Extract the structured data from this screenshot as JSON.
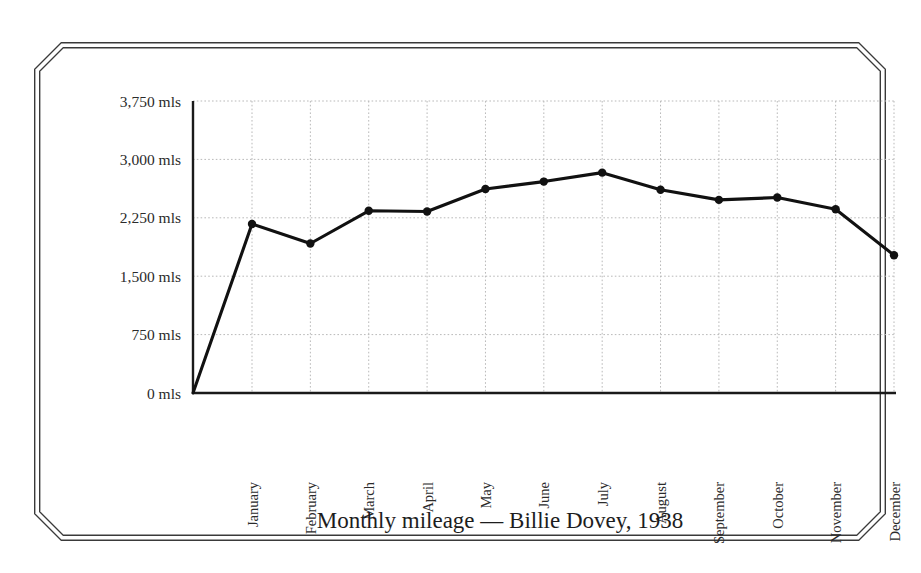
{
  "chart_data": {
    "type": "line",
    "title": "Monthly mileage — Billie Dovey, 1938",
    "xlabel": "",
    "ylabel": "",
    "categories": [
      "January",
      "February",
      "March",
      "April",
      "May",
      "June",
      "July",
      "August",
      "September",
      "October",
      "November",
      "December"
    ],
    "values": [
      2170,
      1920,
      2340,
      2330,
      2620,
      2715,
      2830,
      2610,
      2480,
      2510,
      2360,
      1770
    ],
    "series": [
      {
        "name": "Monthly mileage",
        "values": [
          2170,
          1920,
          2340,
          2330,
          2620,
          2715,
          2830,
          2610,
          2480,
          2510,
          2360,
          1770
        ]
      }
    ],
    "origin_value": 0,
    "ylim": [
      0,
      3750
    ],
    "y_ticks": [
      0,
      750,
      1500,
      2250,
      3000,
      3750
    ],
    "y_tick_labels": [
      "0 mls",
      "750 mls",
      "1,500 mls",
      "2,250 mls",
      "3,000 mls",
      "3,750 mls"
    ],
    "unit_suffix": "mls",
    "grid": true,
    "grid_style": "dotted",
    "legend": false,
    "legend_position": "none",
    "marker": "filled-circle",
    "line_color": "#111111",
    "marker_color": "#111111",
    "grid_color": "#b9b9b9",
    "axis_color": "#1a1a1a",
    "background_color": "#ffffff",
    "x_tick_rotation": 90,
    "note": "Line begins at the y-axis origin (0 mls) and rises to January."
  },
  "frame": {
    "style": "double-line-chamfered-border",
    "color": "#3a3a3a"
  },
  "icons": {
    "data_point": "filled-circle-icon"
  }
}
